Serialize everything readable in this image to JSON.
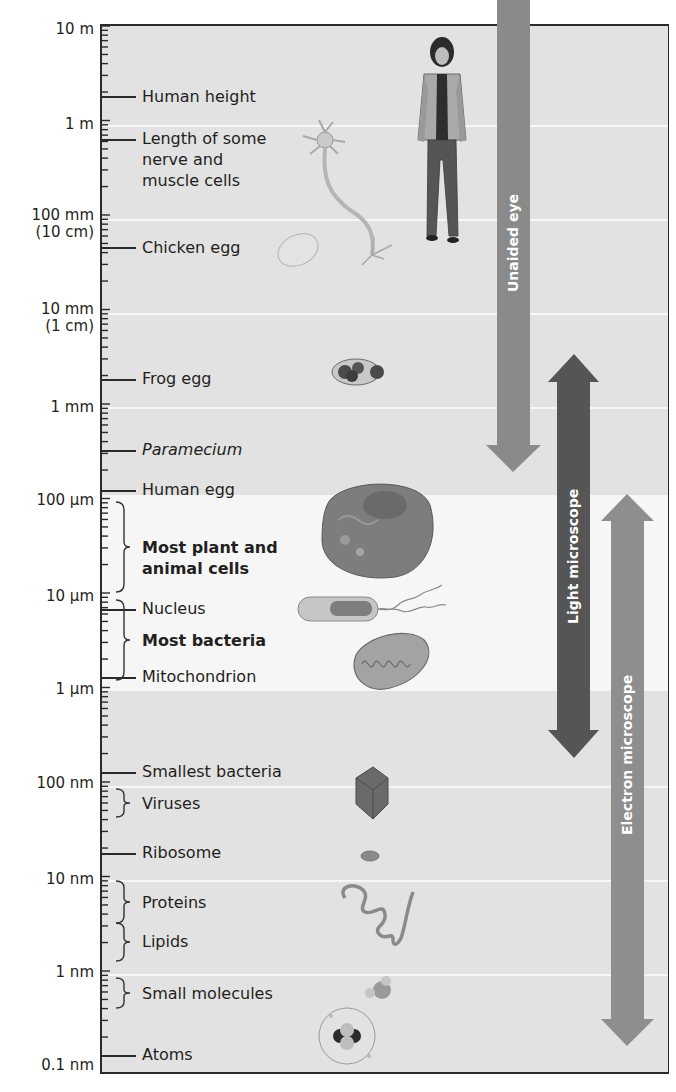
{
  "figure": {
    "colors": {
      "panel_bg": "#e2e2e2",
      "cell_band_bg": "#f6f6f6",
      "unaided_eye_arrow": "#8a8a8a",
      "light_microscope_arrow": "#555555",
      "electron_microscope_arrow": "#8e8e8e",
      "axis": "#2a2a2a"
    },
    "scale_labels": [
      {
        "label": "10 m",
        "y": 30
      },
      {
        "label": "1 m",
        "y": 125
      },
      {
        "label": "100 mm",
        "sub": "(10 cm)",
        "y": 219
      },
      {
        "label": "10 mm",
        "sub": "(1 cm)",
        "y": 313
      },
      {
        "label": "1 mm",
        "y": 408
      },
      {
        "label": "100 µm",
        "y": 501
      },
      {
        "label": "10 µm",
        "y": 597
      },
      {
        "label": "1 µm",
        "y": 690
      },
      {
        "label": "100 nm",
        "y": 784
      },
      {
        "label": "10 nm",
        "y": 880
      },
      {
        "label": "1 nm",
        "y": 973
      },
      {
        "label": "0.1 nm",
        "y": 1066
      }
    ],
    "items": [
      {
        "label": "Human height",
        "style": "normal",
        "y": 97,
        "marker": "line",
        "illustration": "woman-icon"
      },
      {
        "label_lines": [
          "Length of some",
          "nerve and",
          "muscle cells"
        ],
        "style": "normal",
        "y": 139,
        "marker": "line",
        "illustration": "neuron-icon"
      },
      {
        "label": "Chicken egg",
        "style": "normal",
        "y": 248,
        "marker": "line",
        "illustration": "chicken-egg-icon"
      },
      {
        "label": "Frog egg",
        "style": "normal",
        "y": 379,
        "marker": "line",
        "illustration": "frog-egg-icon"
      },
      {
        "label": "Paramecium",
        "style": "italic",
        "y": 450,
        "marker": "line"
      },
      {
        "label": "Human egg",
        "style": "normal",
        "y": 490,
        "marker": "line"
      },
      {
        "label_lines": [
          "Most plant and",
          "animal cells"
        ],
        "style": "bold",
        "y": 547,
        "marker": "brace",
        "illustration": "animal-cell-icon"
      },
      {
        "label": "Nucleus",
        "style": "normal",
        "y": 609,
        "marker": "line"
      },
      {
        "label": "Most bacteria",
        "style": "bold",
        "y": 643,
        "marker": "brace",
        "illustration": "bacterium-icon"
      },
      {
        "label": "Mitochondrion",
        "style": "normal",
        "y": 677,
        "marker": "line",
        "illustration": "mitochondrion-icon"
      },
      {
        "label": "Smallest bacteria",
        "style": "normal",
        "y": 772,
        "marker": "line"
      },
      {
        "label": "Viruses",
        "style": "normal",
        "y": 803,
        "marker": "brace",
        "illustration": "virus-icon"
      },
      {
        "label": "Ribosome",
        "style": "normal",
        "y": 853,
        "marker": "line",
        "illustration": "ribosome-icon"
      },
      {
        "label": "Proteins",
        "style": "normal",
        "y": 903,
        "marker": "brace",
        "illustration": "protein-icon"
      },
      {
        "label": "Lipids",
        "style": "normal",
        "y": 942,
        "marker": "brace"
      },
      {
        "label": "Small molecules",
        "style": "normal",
        "y": 994,
        "marker": "brace",
        "illustration": "small-molecule-icon"
      },
      {
        "label": "Atoms",
        "style": "normal",
        "y": 1055,
        "marker": "line",
        "illustration": "atom-icon"
      }
    ],
    "arrows": [
      {
        "label": "Unaided eye",
        "direction": "down",
        "from": "above 10 m",
        "to": "~100 µm"
      },
      {
        "label": "Light microscope",
        "direction": "both",
        "from": "~1 mm",
        "to": "~200 nm"
      },
      {
        "label": "Electron microscope",
        "direction": "both",
        "from": "~100 µm",
        "to": "~0.1 nm"
      }
    ]
  }
}
